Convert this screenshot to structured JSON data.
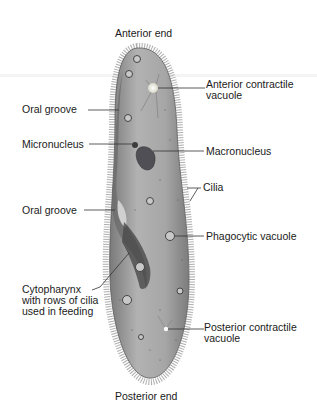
{
  "diagram": {
    "labels": {
      "anterior_end": "Anterior end",
      "posterior_end": "Posterior end",
      "anterior_contractile_vacuole_1": "Anterior contractile",
      "anterior_contractile_vacuole_2": "vacuole",
      "oral_groove_top": "Oral groove",
      "micronucleus": "Micronucleus",
      "macronucleus": "Macronucleus",
      "cilia": "Cilia",
      "oral_groove_mid": "Oral groove",
      "phagocytic_vacuole": "Phagocytic vacuole",
      "cytopharynx_1": "Cytopharynx",
      "cytopharynx_2": "with rows of cilia",
      "cytopharynx_3": "used in feeding",
      "posterior_contractile_vacuole_1": "Posterior contractile",
      "posterior_contractile_vacuole_2": "vacuole"
    },
    "colors": {
      "body_fill": "#a9a9a9",
      "body_dark": "#6e6e6e",
      "leader_line": "#333333",
      "text": "#1a1a1a"
    }
  }
}
